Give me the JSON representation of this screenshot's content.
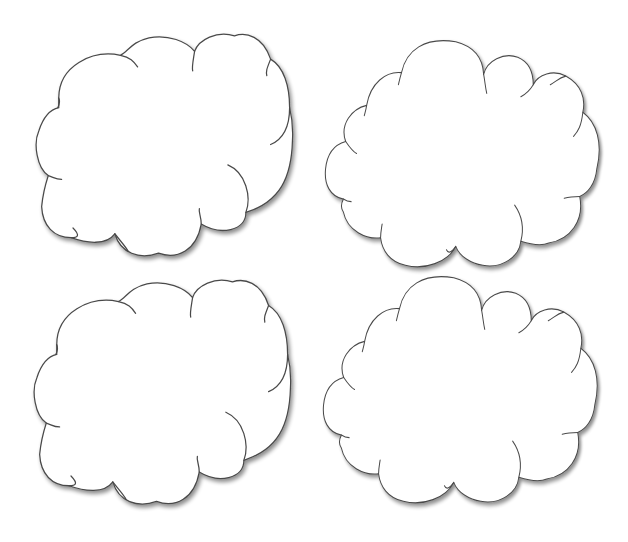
{
  "page": {
    "background_color": "#ffffff",
    "width": 628,
    "height": 542
  },
  "style": {
    "outline_color": "#4a4a4a",
    "fill_color": "#ffffff",
    "shadow_color": "#000000"
  },
  "clouds": [
    {
      "id": "cloud-top-left",
      "position": "top-left",
      "shape": "A",
      "x": 35,
      "y": 32
    },
    {
      "id": "cloud-top-right",
      "position": "top-right",
      "shape": "B",
      "x": 323,
      "y": 40
    },
    {
      "id": "cloud-bottom-left",
      "position": "bottom-left",
      "shape": "A",
      "x": 33,
      "y": 278
    },
    {
      "id": "cloud-bottom-right",
      "position": "bottom-right",
      "shape": "B",
      "x": 322,
      "y": 276
    }
  ]
}
